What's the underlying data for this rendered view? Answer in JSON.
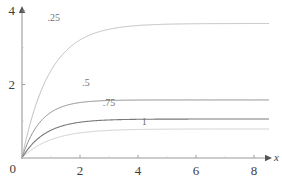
{
  "chart_data": {
    "type": "line",
    "title": "",
    "subtitle": "",
    "xlabel": "x",
    "ylabel": "",
    "xlim": [
      0,
      8.6
    ],
    "ylim": [
      0,
      4.3
    ],
    "grid": false,
    "legend_position": "inline-curve-labels",
    "x_ticks": [
      {
        "value": 0,
        "label": "0"
      },
      {
        "value": 2,
        "label": "2"
      },
      {
        "value": 4,
        "label": "4"
      },
      {
        "value": 6,
        "label": "6"
      },
      {
        "value": 8,
        "label": "8"
      }
    ],
    "x_minor_ticks": [
      1,
      3,
      5,
      7
    ],
    "y_ticks": [
      {
        "value": 0,
        "label": "0"
      },
      {
        "value": 2,
        "label": "2"
      },
      {
        "value": 4,
        "label": "4"
      }
    ],
    "y_minor_ticks": [
      1,
      3
    ],
    "axes_style": "arrows",
    "annotations": [
      {
        "text": ".25",
        "x": 0.95,
        "y": 3.8
      },
      {
        "text": ".5",
        "x": 2.15,
        "y": 2.05
      },
      {
        "text": ".75",
        "x": 2.85,
        "y": 1.5
      },
      {
        "text": "1",
        "x": 4.2,
        "y": 0.98
      }
    ],
    "series": [
      {
        "name": ".25",
        "color": "#b9b9b9",
        "width": 0.9,
        "asymptote": 3.66,
        "rate": 1.05,
        "model": "y = A*(1 - exp(-r*x))",
        "points": [
          [
            0,
            0
          ],
          [
            0.1,
            0.363
          ],
          [
            0.2,
            0.7
          ],
          [
            0.3,
            1.0
          ],
          [
            0.4,
            1.27
          ],
          [
            0.5,
            1.51
          ],
          [
            0.6,
            1.73
          ],
          [
            0.8,
            2.09
          ],
          [
            1.0,
            2.38
          ],
          [
            1.25,
            2.68
          ],
          [
            1.5,
            2.91
          ],
          [
            1.75,
            3.08
          ],
          [
            2.0,
            3.21
          ],
          [
            2.5,
            3.4
          ],
          [
            3.0,
            3.51
          ],
          [
            3.5,
            3.57
          ],
          [
            4.0,
            3.61
          ],
          [
            5.0,
            3.64
          ],
          [
            6.0,
            3.655
          ],
          [
            7.0,
            3.66
          ],
          [
            8.0,
            3.66
          ],
          [
            8.5,
            3.66
          ]
        ]
      },
      {
        "name": ".5",
        "color": "#8e8e8e",
        "width": 1.0,
        "asymptote": 1.58,
        "rate": 1.55,
        "model": "y = A*(1 - exp(-r*x))",
        "points": [
          [
            0,
            0
          ],
          [
            0.1,
            0.226
          ],
          [
            0.2,
            0.42
          ],
          [
            0.3,
            0.586
          ],
          [
            0.4,
            0.73
          ],
          [
            0.5,
            0.851
          ],
          [
            0.6,
            0.955
          ],
          [
            0.8,
            1.12
          ],
          [
            1.0,
            1.243
          ],
          [
            1.25,
            1.353
          ],
          [
            1.5,
            1.426
          ],
          [
            1.75,
            1.475
          ],
          [
            2.0,
            1.508
          ],
          [
            2.5,
            1.547
          ],
          [
            3.0,
            1.565
          ],
          [
            3.5,
            1.573
          ],
          [
            4.0,
            1.577
          ],
          [
            5.0,
            1.579
          ],
          [
            6.0,
            1.58
          ],
          [
            7.0,
            1.58
          ],
          [
            8.0,
            1.58
          ],
          [
            8.5,
            1.58
          ]
        ]
      },
      {
        "name": ".75",
        "color": "#7a7a7a",
        "width": 1.1,
        "asymptote": 1.06,
        "rate": 1.25,
        "model": "y = A*(1 - exp(-r*x))",
        "points": [
          [
            0,
            0
          ],
          [
            0.1,
            0.125
          ],
          [
            0.2,
            0.235
          ],
          [
            0.3,
            0.332
          ],
          [
            0.4,
            0.417
          ],
          [
            0.5,
            0.492
          ],
          [
            0.6,
            0.558
          ],
          [
            0.8,
            0.667
          ],
          [
            1.0,
            0.756
          ],
          [
            1.25,
            0.836
          ],
          [
            1.5,
            0.897
          ],
          [
            1.75,
            0.942
          ],
          [
            2.0,
            0.973
          ],
          [
            2.5,
            1.013
          ],
          [
            3.0,
            1.035
          ],
          [
            3.5,
            1.047
          ],
          [
            4.0,
            1.053
          ],
          [
            5.0,
            1.058
          ],
          [
            6.0,
            1.06
          ],
          [
            7.0,
            1.06
          ],
          [
            8.0,
            1.06
          ],
          [
            8.5,
            1.06
          ]
        ]
      },
      {
        "name": "1",
        "color": "#cfcfcf",
        "width": 1.0,
        "asymptote": 0.79,
        "rate": 1.0,
        "model": "y = A*(1 - exp(-r*x))",
        "points": [
          [
            0,
            0
          ],
          [
            0.1,
            0.075
          ],
          [
            0.2,
            0.143
          ],
          [
            0.3,
            0.205
          ],
          [
            0.4,
            0.26
          ],
          [
            0.5,
            0.311
          ],
          [
            0.6,
            0.356
          ],
          [
            0.8,
            0.435
          ],
          [
            1.0,
            0.499
          ],
          [
            1.25,
            0.563
          ],
          [
            1.5,
            0.614
          ],
          [
            1.75,
            0.653
          ],
          [
            2.0,
            0.683
          ],
          [
            2.5,
            0.725
          ],
          [
            3.0,
            0.751
          ],
          [
            3.5,
            0.766
          ],
          [
            4.0,
            0.776
          ],
          [
            5.0,
            0.785
          ],
          [
            6.0,
            0.788
          ],
          [
            7.0,
            0.789
          ],
          [
            8.0,
            0.79
          ],
          [
            8.5,
            0.79
          ]
        ]
      }
    ]
  },
  "axes": {
    "x_axis_label": "x",
    "origin_label": "0"
  },
  "colors": {
    "axis": "#9a9a9a",
    "text": "#3d3d3d",
    "background": "#ffffff"
  }
}
